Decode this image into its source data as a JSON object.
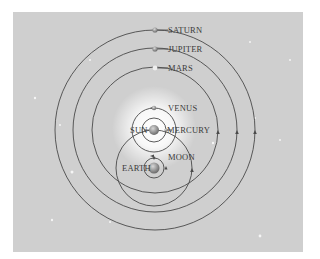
{
  "diagram": {
    "type": "Tychonic geo-heliocentric model",
    "colors": {
      "background": "#cfcfcf",
      "orbit": "#4a4a4a",
      "label": "#3a3a3a",
      "sun_glow": "#ffffff",
      "body": "#888888"
    },
    "center_sun": {
      "label": "SUN",
      "cx": 154,
      "cy": 130
    },
    "center_earth": {
      "label": "EARTH",
      "cx": 154,
      "cy": 168
    },
    "bodies": [
      {
        "label": "SATURN",
        "orbit_r": 100,
        "around": "sun"
      },
      {
        "label": "JUPITER",
        "orbit_r": 82,
        "around": "sun"
      },
      {
        "label": "MARS",
        "orbit_r": 63,
        "around": "sun"
      },
      {
        "label": "VENUS",
        "orbit_r": 22,
        "around": "sun"
      },
      {
        "label": "MERCURY",
        "orbit_r": 12,
        "around": "sun"
      },
      {
        "label": "MOON",
        "orbit_r": 10,
        "around": "earth"
      }
    ],
    "sun_orbit_around_earth_r": 38
  }
}
